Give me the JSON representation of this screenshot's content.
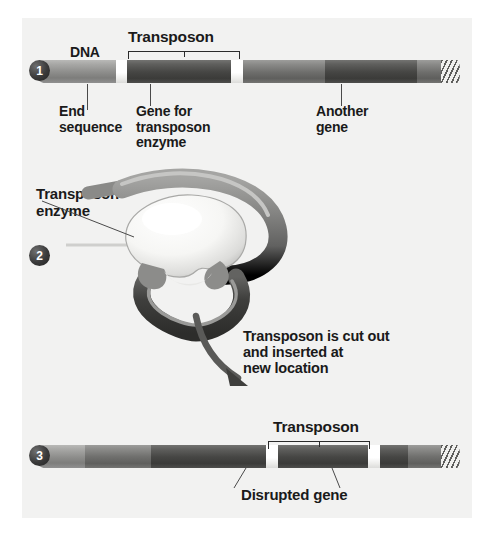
{
  "figure": {
    "background_color": "#f2f2f1",
    "ink_color": "#1a1a1a"
  },
  "steps": [
    {
      "number": "1"
    },
    {
      "number": "2"
    },
    {
      "number": "3"
    }
  ],
  "panel1": {
    "dna_label": "DNA",
    "transposon_label": "Transposon",
    "end_sequence_label": "End\nsequence",
    "gene_for_enzyme_label": "Gene for\ntransposon\nenzyme",
    "another_gene_label": "Another\ngene"
  },
  "panel2": {
    "enzyme_label": "Transposon\nenzyme"
  },
  "transition": {
    "caption": "Transposon is cut out\nand inserted at\nnew location"
  },
  "panel3": {
    "transposon_label": "Transposon",
    "disrupted_gene_label": "Disrupted gene"
  },
  "colors": {
    "dna_light": "#8e8e8c",
    "dna_mid": "#6f6f6d",
    "transposon_dark": "#464644",
    "end_sequence": "#ffffff",
    "badge": "#2f2f2f"
  }
}
